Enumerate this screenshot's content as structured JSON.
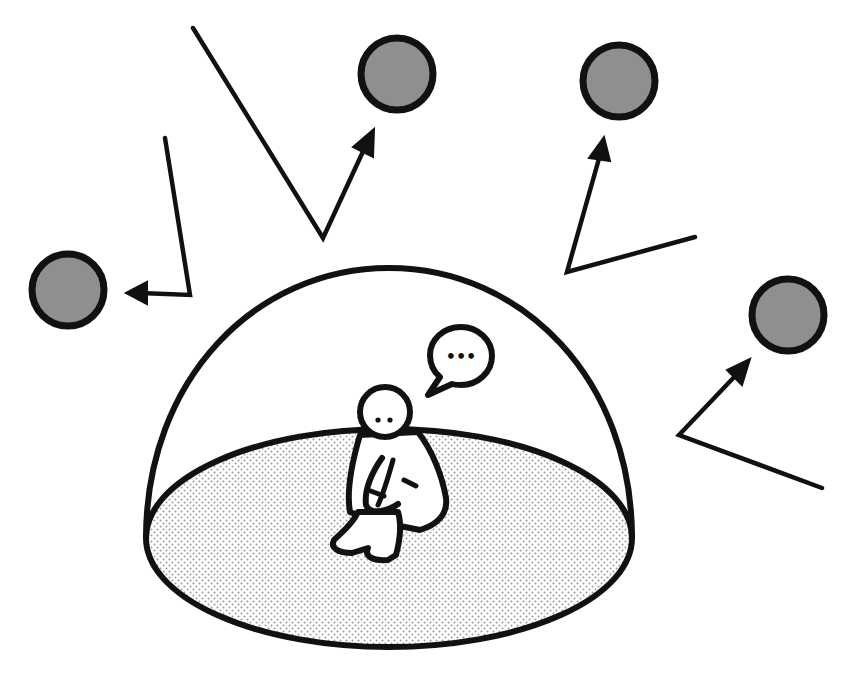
{
  "scene": {
    "description": "Person sitting alone inside a protective dome while balls bounce off it",
    "colors": {
      "background": "#ffffff",
      "stroke": "#111111",
      "ball_fill": "#8f8f8f",
      "floor_dot": "#9a9a9a"
    }
  },
  "speech_bubble": {
    "text": "•••"
  },
  "balls": [
    {
      "id": "ball-left",
      "cx": 68,
      "cy": 290,
      "r": 36
    },
    {
      "id": "ball-top-left",
      "cx": 397,
      "cy": 74,
      "r": 36
    },
    {
      "id": "ball-top-right",
      "cx": 619,
      "cy": 81,
      "r": 36
    },
    {
      "id": "ball-right",
      "cx": 788,
      "cy": 315,
      "r": 36
    }
  ],
  "arrows": [
    {
      "id": "arrow-left",
      "points": "165,138 190,295 140,293",
      "head": "128,293 146,283 146,303"
    },
    {
      "id": "arrow-top-left",
      "points": "193,28 323,238 366,142",
      "head": "372,130 355,148 374,153"
    },
    {
      "id": "arrow-top-right",
      "points": "695,237 567,272 601,150",
      "head": "604,138 594,158 610,160"
    },
    {
      "id": "arrow-right",
      "points": "822,488 679,435 740,370",
      "head": "749,360 728,370 742,384"
    }
  ]
}
